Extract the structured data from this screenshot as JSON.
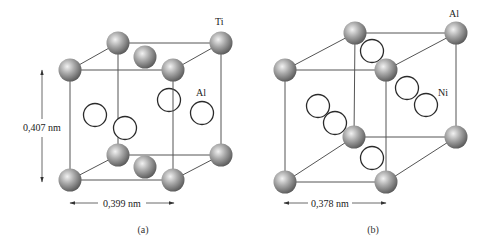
{
  "figure_a": {
    "caption": "(a)",
    "corner_atom_label": "Ti",
    "face_atom_label": "Al",
    "height_dimension": "0,407 nm",
    "width_dimension": "0,399 nm"
  },
  "figure_b": {
    "caption": "(b)",
    "corner_atom_label": "Al",
    "face_atom_label": "Ni",
    "width_dimension": "0,378 nm"
  },
  "colors": {
    "solid_atom_light": "#e8e8e8",
    "solid_atom_mid": "#9a9a9a",
    "solid_atom_dark": "#5a5a5a",
    "open_atom_stroke": "#2a2a2a",
    "edge_line": "#555555"
  }
}
